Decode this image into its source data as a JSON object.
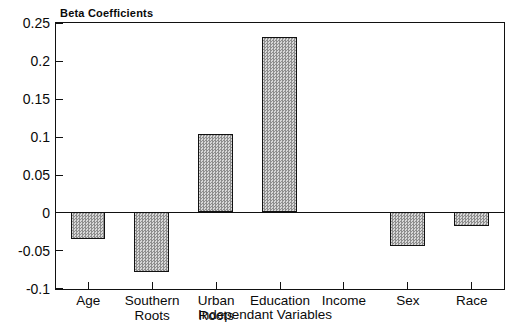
{
  "chart_data": {
    "type": "bar",
    "title": "Beta  Coefficients",
    "xlabel": "Independant  Variables",
    "ylabel": "",
    "categories": [
      "Age",
      "Southern\nRoots",
      "Urban\nRoots",
      "Education",
      "Income",
      "Sex",
      "Race"
    ],
    "values": [
      -0.035,
      -0.078,
      0.104,
      0.232,
      0.0,
      -0.044,
      -0.018
    ],
    "ylim": [
      -0.1,
      0.25
    ],
    "yticks": [
      0.25,
      0.2,
      0.15,
      0.1,
      0.05,
      0,
      -0.05,
      -0.1
    ],
    "ytick_labels": [
      "0.25",
      "0.2",
      "0.15",
      "0.1",
      "0.05",
      "0",
      "-0.05",
      "-0.1"
    ],
    "grid": false,
    "legend": null,
    "bar_color": "#b9b9b9",
    "bar_edge_color": "#111111",
    "axis_color": "#111111"
  }
}
